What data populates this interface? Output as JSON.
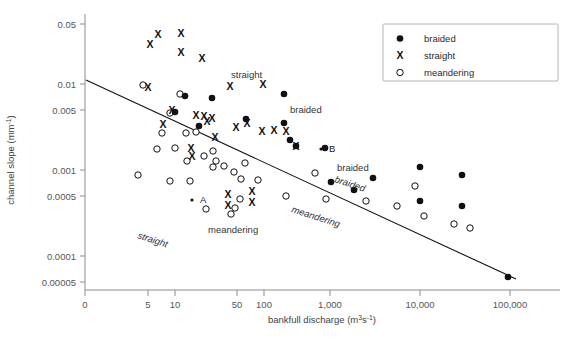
{
  "chart_data": {
    "type": "scatter",
    "title": "",
    "xlabel": "bankfull discharge (m3s-1)",
    "xlabel_main": "bankfull discharge (m",
    "xlabel_sup1": "3",
    "xlabel_mid": "s",
    "xlabel_sup2": "-1",
    "xlabel_end": ")",
    "ylabel": "channel slope (mm-1)",
    "ylabel_main": "channel slope (mm",
    "ylabel_sup": "-1",
    "ylabel_end": ")",
    "xscale": "log",
    "yscale": "log",
    "xlim": [
      3,
      150000
    ],
    "ylim": [
      5e-05,
      0.05
    ],
    "grid": false,
    "legend_position": "top-right",
    "xticks": [
      {
        "label": "0",
        "value": 0,
        "px": 85
      },
      {
        "label": "5",
        "value": 5,
        "px": 148
      },
      {
        "label": "10",
        "value": 10,
        "px": 175
      },
      {
        "label": "50",
        "value": 50,
        "px": 237
      },
      {
        "label": "100",
        "value": 100,
        "px": 264
      },
      {
        "label": "1,000",
        "value": 1000,
        "px": 330
      },
      {
        "label": "10,000",
        "value": 10000,
        "px": 420
      },
      {
        "label": "100,000",
        "value": 100000,
        "px": 510
      }
    ],
    "yticks": [
      {
        "label": "0.05",
        "value": 0.05,
        "px": 24
      },
      {
        "label": "0.01",
        "value": 0.01,
        "px": 84
      },
      {
        "label": "0.005",
        "value": 0.005,
        "px": 110
      },
      {
        "label": "0.001",
        "value": 0.001,
        "px": 170
      },
      {
        "label": "0.0005",
        "value": 0.0005,
        "px": 196
      },
      {
        "label": "0.0001",
        "value": 0.0001,
        "px": 256
      },
      {
        "label": "0.00005",
        "value": 5e-05,
        "px": 282
      }
    ],
    "legend": [
      {
        "label": "braided",
        "marker": "filled-circle"
      },
      {
        "label": "straight",
        "marker": "x"
      },
      {
        "label": "meandering",
        "marker": "open-circle"
      }
    ],
    "trend_line": {
      "x1_px": 86,
      "y1_px": 80,
      "x2_px": 516,
      "y2_px": 279,
      "description": "negative log-log regression line"
    },
    "annotations": [
      {
        "text": "straight",
        "style": "plain",
        "rotation": 0,
        "x_px": 231,
        "y_px": 78
      },
      {
        "text": "braided",
        "style": "plain",
        "rotation": 0,
        "x_px": 290,
        "y_px": 113
      },
      {
        "text": "braided",
        "style": "plain",
        "rotation": 0,
        "x_px": 337,
        "y_px": 171
      },
      {
        "text": "meandering",
        "style": "plain",
        "rotation": 0,
        "x_px": 208,
        "y_px": 233
      },
      {
        "text": "straight",
        "style": "italic",
        "rotation": 18,
        "x_px": 137,
        "y_px": 238
      },
      {
        "text": "meandering",
        "style": "italic",
        "rotation": 18,
        "x_px": 291,
        "y_px": 212
      },
      {
        "text": "braided",
        "style": "italic",
        "rotation": 18,
        "x_px": 334,
        "y_px": 182
      }
    ],
    "point_labels": [
      {
        "text": "A",
        "x_px": 200,
        "y_px": 203
      },
      {
        "text": "B",
        "x_px": 329,
        "y_px": 152
      }
    ],
    "series": [
      {
        "name": "braided",
        "marker": "filled-circle",
        "points_px": [
          [
            185,
            96
          ],
          [
            175,
            112
          ],
          [
            212,
            98
          ],
          [
            199,
            126
          ],
          [
            246,
            119
          ],
          [
            284,
            94
          ],
          [
            284,
            123
          ],
          [
            290,
            140
          ],
          [
            296,
            146
          ],
          [
            325,
            148
          ],
          [
            331,
            182
          ],
          [
            354,
            190
          ],
          [
            373,
            178
          ],
          [
            420,
            167
          ],
          [
            420,
            201
          ],
          [
            462,
            175
          ],
          [
            462,
            206
          ],
          [
            508,
            277
          ]
        ]
      },
      {
        "name": "straight",
        "marker": "x",
        "points_px": [
          [
            158,
            34
          ],
          [
            150,
            44
          ],
          [
            181,
            33
          ],
          [
            181,
            52
          ],
          [
            202,
            58
          ],
          [
            148,
            87
          ],
          [
            230,
            86
          ],
          [
            263,
            84
          ],
          [
            172,
            110
          ],
          [
            196,
            115
          ],
          [
            204,
            116
          ],
          [
            207,
            121
          ],
          [
            212,
            118
          ],
          [
            236,
            127
          ],
          [
            247,
            123
          ],
          [
            262,
            131
          ],
          [
            274,
            130
          ],
          [
            286,
            131
          ],
          [
            296,
            146
          ],
          [
            191,
            148
          ],
          [
            192,
            156
          ],
          [
            228,
            194
          ],
          [
            228,
            205
          ],
          [
            252,
            191
          ],
          [
            252,
            202
          ],
          [
            163,
            124
          ],
          [
            215,
            137
          ]
        ]
      },
      {
        "name": "meandering",
        "marker": "open-circle",
        "points_px": [
          [
            143,
            85
          ],
          [
            180,
            94
          ],
          [
            170,
            113
          ],
          [
            162,
            133
          ],
          [
            186,
            133
          ],
          [
            196,
            132
          ],
          [
            175,
            148
          ],
          [
            187,
            161
          ],
          [
            204,
            156
          ],
          [
            213,
            151
          ],
          [
            213,
            167
          ],
          [
            224,
            166
          ],
          [
            234,
            172
          ],
          [
            245,
            163
          ],
          [
            170,
            181
          ],
          [
            190,
            181
          ],
          [
            216,
            161
          ],
          [
            241,
            179
          ],
          [
            258,
            180
          ],
          [
            240,
            199
          ],
          [
            231,
            214
          ],
          [
            206,
            209
          ],
          [
            235,
            208
          ],
          [
            286,
            196
          ],
          [
            315,
            173
          ],
          [
            326,
            199
          ],
          [
            366,
            201
          ],
          [
            397,
            206
          ],
          [
            415,
            186
          ],
          [
            424,
            216
          ],
          [
            454,
            224
          ],
          [
            470,
            228
          ],
          [
            138,
            175
          ],
          [
            157,
            149
          ]
        ]
      }
    ]
  },
  "plot_area": {
    "left_px": 85,
    "right_px": 560,
    "top_px": 14,
    "bottom_px": 290
  }
}
